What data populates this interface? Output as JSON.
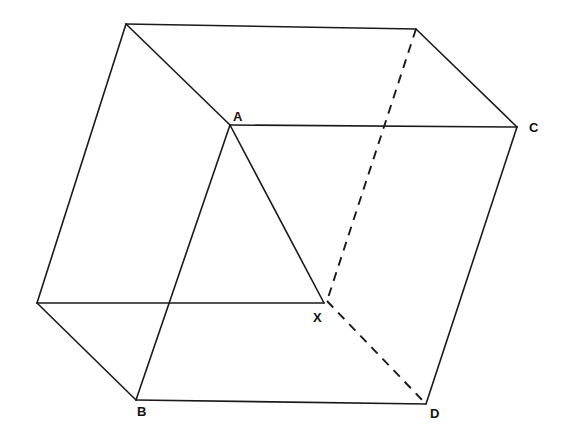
{
  "figure": {
    "background_color": "#ffffff",
    "stroke_color": "#1a1a1a",
    "width": 565,
    "height": 437
  },
  "labels": [
    {
      "id": "label-a",
      "text": "A",
      "x": 233,
      "y": 110
    },
    {
      "id": "label-c",
      "text": "C",
      "x": 529,
      "y": 121
    },
    {
      "id": "label-x",
      "text": "X",
      "x": 313,
      "y": 311
    },
    {
      "id": "label-b",
      "text": "B",
      "x": 137,
      "y": 405
    },
    {
      "id": "label-d",
      "text": "D",
      "x": 430,
      "y": 407
    }
  ],
  "points": {
    "top_left": {
      "name": "top-left-vertex",
      "x": 126,
      "y": 24
    },
    "top_right": {
      "name": "top-right-vertex",
      "x": 416,
      "y": 29
    },
    "a": {
      "name": "vertex-a",
      "x": 230,
      "y": 125
    },
    "c": {
      "name": "vertex-c",
      "x": 517,
      "y": 127
    },
    "left_middle": {
      "name": "left-middle-vertex",
      "x": 37,
      "y": 303
    },
    "x": {
      "name": "point-x",
      "x": 324,
      "y": 303
    },
    "b": {
      "name": "vertex-b",
      "x": 136,
      "y": 400
    },
    "d": {
      "name": "vertex-d",
      "x": 426,
      "y": 404
    }
  },
  "edges_solid": [
    {
      "name": "edge-top-back",
      "d": "M126,24 L416,29"
    },
    {
      "name": "edge-top-left-to-a",
      "d": "M126,24 L230,125"
    },
    {
      "name": "edge-top-left-to-lm",
      "d": "M126,24 L37,303"
    },
    {
      "name": "edge-a-to-c",
      "d": "M230,125 L517,127"
    },
    {
      "name": "edge-a-to-x",
      "d": "M230,125 L324,303"
    },
    {
      "name": "edge-a-to-b",
      "d": "M230,125 L136,400"
    },
    {
      "name": "edge-lm-to-x",
      "d": "M37,303 L324,303"
    },
    {
      "name": "edge-lm-to-b",
      "d": "M37,303 L136,400"
    },
    {
      "name": "edge-top-right-to-c",
      "d": "M416,29 L517,127"
    },
    {
      "name": "edge-c-to-d",
      "d": "M517,127 L426,404"
    },
    {
      "name": "edge-b-to-d",
      "d": "M136,400 L426,404"
    }
  ],
  "edges_dashed": [
    {
      "name": "hidden-edge-top-right-to-x",
      "d": "M416,29 L327,301"
    },
    {
      "name": "hidden-edge-x-to-d",
      "d": "M327,301 L426,404"
    }
  ]
}
